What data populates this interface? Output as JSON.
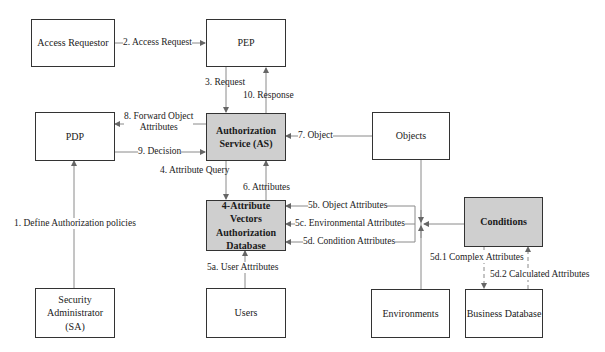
{
  "diagram": {
    "nodes": {
      "access_requestor": "Access Requestor",
      "pep": "PEP",
      "pdp": "PDP",
      "as_line1": "Authorization",
      "as_line2": "Service (AS)",
      "objects": "Objects",
      "db_line1": "4-Attribute Vectors",
      "db_line2": "Authorization",
      "db_line3": "Database",
      "conditions": "Conditions",
      "sa_line1": "Security",
      "sa_line2": "Administrator (SA)",
      "users": "Users",
      "environments": "Environments",
      "business_db": "Business Database"
    },
    "edges": {
      "e1": "1. Define Authorization policies",
      "e2": "2. Access Request",
      "e3": "3. Request",
      "e4": "4. Attribute Query",
      "e5a": "5a. User Attributes",
      "e5b": "5b. Object Attributes",
      "e5c": "5c. Environmental Attributes",
      "e5d": "5d. Condition Attributes",
      "e5d1": "5d.1 Complex Attributes",
      "e5d2": "5d.2 Calculated Attributes",
      "e6": "6. Attributes",
      "e7": "7. Object",
      "e8_line1": "8. Forward Object",
      "e8_line2": "Attributes",
      "e9": "9. Decision",
      "e10": "10. Response"
    },
    "colors": {
      "shaded_box": "#cfcfcf",
      "line": "#888888",
      "border": "#333333"
    }
  }
}
